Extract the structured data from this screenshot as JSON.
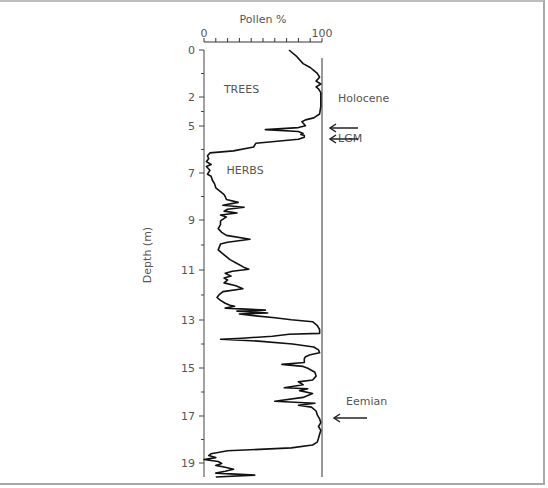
{
  "chart_data": {
    "type": "line",
    "orientation": "vertical-profile",
    "title": "",
    "xlabel": "Pollen %",
    "ylabel": "Depth (m)",
    "xlim": [
      0,
      100
    ],
    "x_tick_labels": [
      "0",
      "100"
    ],
    "x_minor_ticks": [
      0,
      10,
      20,
      30,
      40,
      50,
      60,
      70,
      80,
      90,
      100
    ],
    "y_tick_labels": [
      "0",
      "2",
      "5",
      "7",
      "9",
      "11",
      "13",
      "15",
      "17",
      "19"
    ],
    "y_tick_pixels": [
      50,
      97,
      126,
      173,
      220,
      270,
      320,
      368,
      416,
      463
    ],
    "region_labels": [
      {
        "text": "TREES",
        "depth": 2.0,
        "pct": 25
      },
      {
        "text": "HERBS",
        "depth": 6.2,
        "pct": 28
      }
    ],
    "annotations": [
      {
        "text": "Holocene",
        "depth": 2.4,
        "arrow": false
      },
      {
        "text": "LGM",
        "depth": 5.3,
        "arrow": true,
        "arrow_depths": [
          5.0,
          5.55
        ]
      },
      {
        "text": "Eemian",
        "depth": 16.5,
        "arrow": true,
        "arrow_depths": [
          17.0
        ]
      }
    ],
    "series": [
      {
        "name": "Trees pollen %",
        "points": [
          [
            0.0,
            72
          ],
          [
            0.3,
            78
          ],
          [
            0.7,
            84
          ],
          [
            0.9,
            90
          ],
          [
            1.05,
            93
          ],
          [
            1.2,
            96
          ],
          [
            1.4,
            98
          ],
          [
            1.6,
            95
          ],
          [
            1.75,
            99
          ],
          [
            1.9,
            95
          ],
          [
            2.0,
            97
          ],
          [
            2.2,
            99
          ],
          [
            2.5,
            99
          ],
          [
            2.9,
            99
          ],
          [
            3.3,
            98
          ],
          [
            3.5,
            93
          ],
          [
            3.6,
            86
          ],
          [
            3.7,
            83
          ],
          [
            3.9,
            86
          ],
          [
            4.0,
            80
          ],
          [
            4.1,
            52
          ],
          [
            4.2,
            80
          ],
          [
            4.3,
            84
          ],
          [
            4.35,
            82
          ],
          [
            4.4,
            85
          ],
          [
            4.5,
            85
          ],
          [
            4.6,
            80
          ],
          [
            4.8,
            44
          ],
          [
            5.0,
            42
          ],
          [
            5.2,
            25
          ],
          [
            5.3,
            5
          ],
          [
            5.45,
            3
          ],
          [
            5.6,
            4
          ],
          [
            5.75,
            2
          ],
          [
            5.9,
            6
          ],
          [
            6.0,
            2
          ],
          [
            6.2,
            5
          ],
          [
            6.4,
            3
          ],
          [
            6.5,
            6
          ],
          [
            6.7,
            7
          ],
          [
            6.9,
            9
          ],
          [
            7.1,
            10
          ],
          [
            7.3,
            14
          ],
          [
            7.45,
            17
          ],
          [
            7.55,
            18
          ],
          [
            7.7,
            19
          ],
          [
            7.85,
            29
          ],
          [
            8.0,
            16
          ],
          [
            8.1,
            34
          ],
          [
            8.2,
            20
          ],
          [
            8.3,
            17
          ],
          [
            8.4,
            28
          ],
          [
            8.5,
            14
          ],
          [
            8.6,
            19
          ],
          [
            8.8,
            14
          ],
          [
            9.0,
            14
          ],
          [
            9.2,
            12
          ],
          [
            9.4,
            15
          ],
          [
            9.55,
            19
          ],
          [
            9.75,
            39
          ],
          [
            9.9,
            20
          ],
          [
            10.0,
            14
          ],
          [
            10.3,
            12
          ],
          [
            10.5,
            16
          ],
          [
            10.8,
            22
          ],
          [
            11.0,
            28
          ],
          [
            11.2,
            34
          ],
          [
            11.3,
            38
          ],
          [
            11.4,
            24
          ],
          [
            11.5,
            18
          ],
          [
            11.65,
            23
          ],
          [
            11.75,
            17
          ],
          [
            11.85,
            20
          ],
          [
            12.0,
            17
          ],
          [
            12.15,
            27
          ],
          [
            12.3,
            33
          ],
          [
            12.45,
            16
          ],
          [
            12.6,
            13
          ],
          [
            12.75,
            11
          ],
          [
            12.9,
            14
          ],
          [
            13.05,
            18
          ],
          [
            13.15,
            22
          ],
          [
            13.2,
            26
          ],
          [
            13.3,
            18
          ],
          [
            13.4,
            52
          ],
          [
            13.45,
            28
          ],
          [
            13.55,
            54
          ],
          [
            13.6,
            30
          ],
          [
            13.7,
            44
          ],
          [
            13.8,
            60
          ],
          [
            13.9,
            74
          ],
          [
            14.0,
            92
          ],
          [
            14.2,
            96
          ],
          [
            14.4,
            98
          ],
          [
            14.6,
            98
          ],
          [
            14.65,
            72
          ],
          [
            14.75,
            58
          ],
          [
            14.85,
            32
          ],
          [
            14.9,
            14
          ],
          [
            15.0,
            46
          ],
          [
            15.15,
            75
          ],
          [
            15.3,
            93
          ],
          [
            15.45,
            97
          ],
          [
            15.6,
            98
          ],
          [
            15.7,
            90
          ],
          [
            15.8,
            86
          ],
          [
            15.9,
            85
          ],
          [
            16.1,
            85
          ],
          [
            16.2,
            66
          ],
          [
            16.3,
            84
          ],
          [
            16.4,
            88
          ],
          [
            16.6,
            94
          ],
          [
            16.8,
            95
          ],
          [
            17.0,
            92
          ],
          [
            17.1,
            80
          ],
          [
            17.25,
            84
          ],
          [
            17.4,
            68
          ],
          [
            17.45,
            88
          ],
          [
            17.55,
            81
          ],
          [
            17.7,
            92
          ],
          [
            17.9,
            84
          ],
          [
            18.1,
            60
          ],
          [
            18.2,
            94
          ],
          [
            18.3,
            80
          ],
          [
            18.4,
            91
          ],
          [
            18.6,
            95
          ],
          [
            18.8,
            96
          ],
          [
            19.0,
            98
          ],
          [
            19.2,
            99
          ],
          [
            19.4,
            97
          ],
          [
            19.6,
            99
          ],
          [
            19.8,
            98
          ],
          [
            20.0,
            97
          ],
          [
            20.2,
            96
          ],
          [
            20.35,
            92
          ],
          [
            20.5,
            74
          ],
          [
            20.65,
            20
          ],
          [
            20.8,
            6
          ],
          [
            20.9,
            4
          ],
          [
            21.0,
            10
          ],
          [
            21.1,
            0
          ],
          [
            21.2,
            12
          ],
          [
            21.3,
            15
          ],
          [
            21.4,
            10
          ],
          [
            21.5,
            18
          ],
          [
            21.6,
            25
          ],
          [
            21.7,
            18
          ],
          [
            21.8,
            10
          ],
          [
            21.9,
            43
          ],
          [
            22.0,
            10
          ]
        ]
      }
    ]
  }
}
